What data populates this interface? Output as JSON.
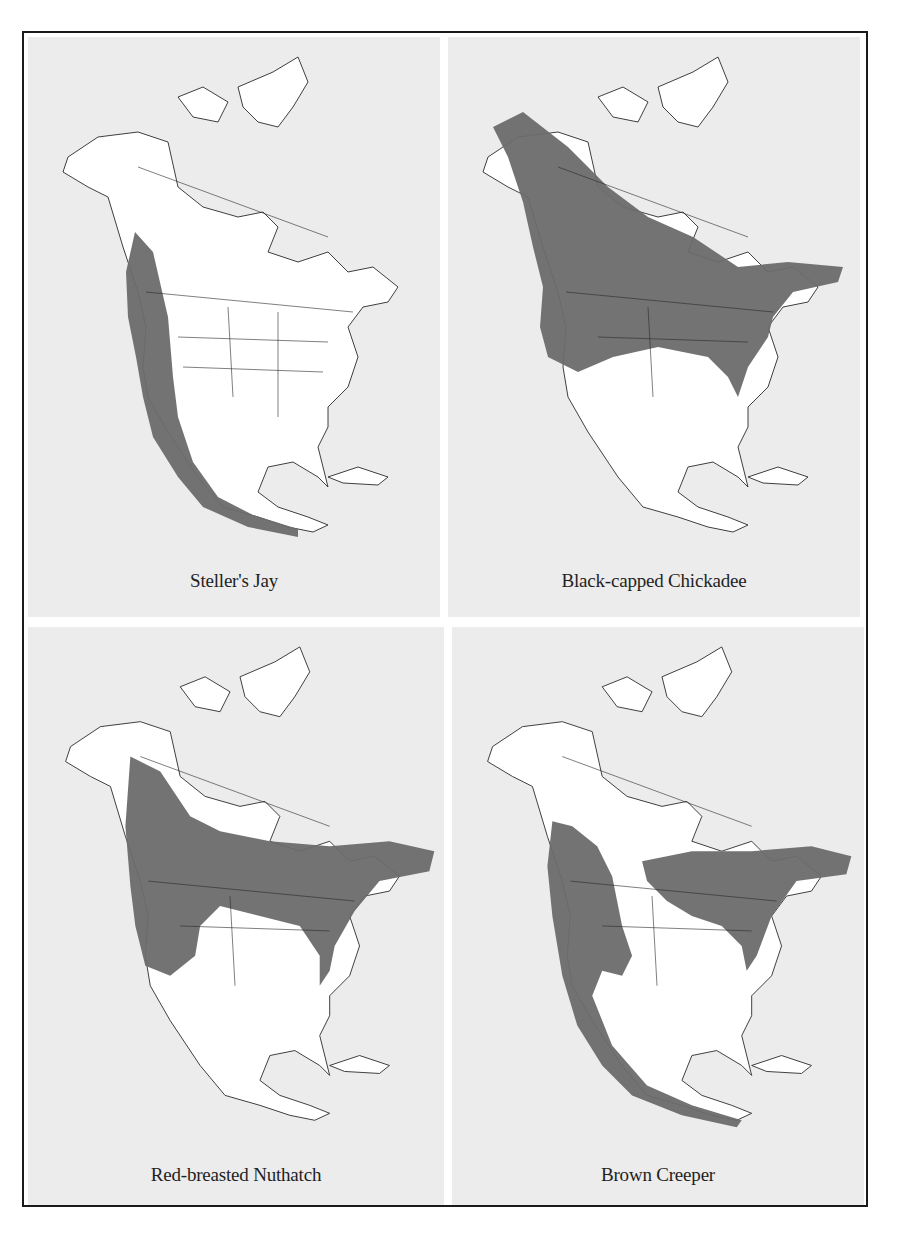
{
  "figure": {
    "frame_color": "#1a1a1a",
    "panel_background": "#ececec",
    "land_color": "#ffffff",
    "range_color": "#6b6b6b",
    "border_color": "#2a2a2a",
    "maps": [
      {
        "id": "stellers-jay",
        "caption": "Steller's Jay",
        "range_description": "Pacific coast from southern Alaska through the western mountains to Mexico and Central America"
      },
      {
        "id": "black-capped-chickadee",
        "caption": "Black-capped Chickadee",
        "range_description": "Alaska and boreal Canada south across the northern United States"
      },
      {
        "id": "red-breasted-nuthatch",
        "caption": "Red-breasted Nuthatch",
        "range_description": "Boreal Canada, the western mountains and the northeastern United States"
      },
      {
        "id": "brown-creeper",
        "caption": "Brown Creeper",
        "range_description": "Western mountains, southern Canada, the northeast, and Mexico to Central America"
      }
    ]
  }
}
